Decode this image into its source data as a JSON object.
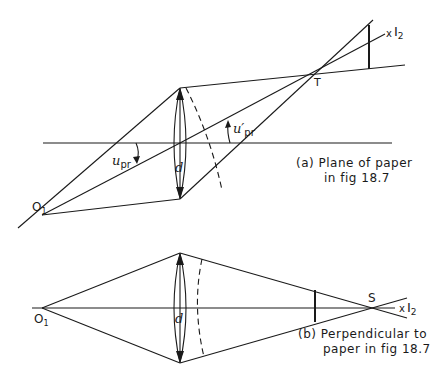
{
  "figure": {
    "panel_a": {
      "caption_line1": "(a) Plane of paper",
      "caption_line2": "in fig 18.7",
      "object_label": "O",
      "object_sub": "1",
      "image_label": "I",
      "image_sub": "2",
      "image_marker": "x",
      "focus_label": "T",
      "aperture_label": "d",
      "angle_in_label": "u",
      "angle_in_sub": "pr",
      "angle_out_label": "u′",
      "angle_out_sub": "pr"
    },
    "panel_b": {
      "caption_line1": "(b) Perpendicular to",
      "caption_line2": "paper in fig 18.7",
      "object_label": "O",
      "object_sub": "1",
      "image_label": "I",
      "image_sub": "2",
      "image_marker": "x",
      "focus_label": "S",
      "aperture_label": "d"
    },
    "colors": {
      "ink": "#1a1a1a",
      "background": "#ffffff"
    }
  }
}
